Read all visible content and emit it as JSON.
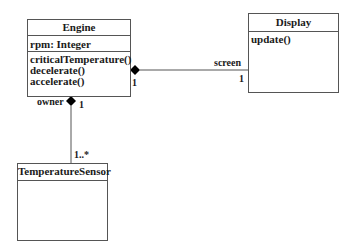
{
  "classes": {
    "engine": {
      "name": "Engine",
      "attributes": [
        "rpm: Integer"
      ],
      "operations": [
        "criticalTemperature()",
        "decelerate()",
        "accelerate()"
      ]
    },
    "display": {
      "name": "Display",
      "operations": [
        "update()"
      ]
    },
    "temperature_sensor": {
      "name": "TemperatureSensor"
    }
  },
  "associations": {
    "engine_display": {
      "type": "composition",
      "engine_end_multiplicity": "1",
      "display_role": "screen",
      "display_multiplicity": "1"
    },
    "engine_sensor": {
      "type": "composition",
      "engine_role": "owner",
      "engine_multiplicity": "1",
      "sensor_multiplicity": "1..*"
    }
  },
  "colors": {
    "line": "#555555",
    "diamond": "#000000",
    "text": "#1a1a1a"
  }
}
